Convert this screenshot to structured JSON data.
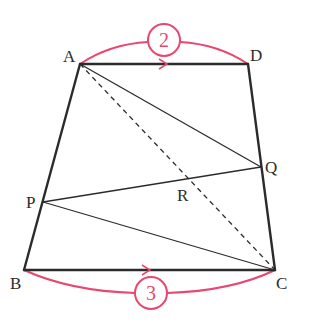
{
  "diagram": {
    "type": "trapezoid",
    "colors": {
      "line": "#2b2b2b",
      "accent": "#e8476e",
      "background": "#ffffff"
    },
    "points": {
      "A": {
        "label": "A",
        "x": 80,
        "y": 64
      },
      "D": {
        "label": "D",
        "x": 248,
        "y": 64
      },
      "B": {
        "label": "B",
        "x": 24,
        "y": 270
      },
      "C": {
        "label": "C",
        "x": 275,
        "y": 270
      },
      "P": {
        "label": "P",
        "x": 43,
        "y": 202
      },
      "Q": {
        "label": "Q",
        "x": 261,
        "y": 167
      },
      "R": {
        "label": "R",
        "x": 184,
        "y": 184
      }
    },
    "segments": [
      "AD",
      "BC",
      "AB",
      "DC",
      "AQ",
      "PQ",
      "PC"
    ],
    "dashed_segments": [
      "AC"
    ],
    "parallel_marks": [
      "AD",
      "BC"
    ],
    "ratios": {
      "AD": {
        "value": "2"
      },
      "BC": {
        "value": "3"
      }
    }
  }
}
